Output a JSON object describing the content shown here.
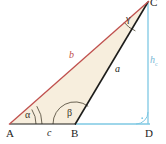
{
  "figure": {
    "kind": "geometry-diagram",
    "background": "#ffffff",
    "fill_color": "#f7eedd",
    "side_b_color": "#c0504d",
    "side_a_color": "#1d1d1b",
    "side_c_color": "#1d1d1b",
    "height_color": "#7ec8e3",
    "arc_color": "#5a5242",
    "label_color": "#1d1d1b"
  },
  "vertices": [
    {
      "name": "A",
      "label": "A",
      "x": 10,
      "y": 124,
      "label_x": 8,
      "label_y": 129
    },
    {
      "name": "B",
      "label": "B",
      "x": 75,
      "y": 124,
      "label_x": 72,
      "label_y": 129
    },
    {
      "name": "C",
      "label": "C",
      "x": 148,
      "y": 2,
      "label_x": 150,
      "label_y": -2
    },
    {
      "name": "D",
      "label": "D",
      "x": 148,
      "y": 124,
      "label_x": 146,
      "label_y": 129
    }
  ],
  "sides": [
    {
      "name": "side-b",
      "label": "b",
      "from": "A",
      "to": "C",
      "color": "#c0504d",
      "label_x": 69,
      "label_y": 51
    },
    {
      "name": "side-a",
      "label": "a",
      "from": "B",
      "to": "C",
      "color": "#1d1d1b",
      "label_x": 115,
      "label_y": 65
    },
    {
      "name": "side-c",
      "label": "c",
      "from": "A",
      "to": "B",
      "color": "#1d1d1b",
      "label_x": 47,
      "label_y": 129
    }
  ],
  "angles": [
    {
      "name": "alpha",
      "label": "α",
      "at": "A",
      "label_x": 25,
      "label_y": 111,
      "marker": "double-arc"
    },
    {
      "name": "beta",
      "label": "β",
      "at": "B",
      "label_x": 68,
      "label_y": 110,
      "marker": "single-arc-obtuse"
    },
    {
      "name": "gamma",
      "label": "γ",
      "at": "C",
      "label_x": 126,
      "label_y": 15,
      "marker": "single-arc"
    },
    {
      "name": "right-angle",
      "label": "",
      "at": "D",
      "label_x": 0,
      "label_y": 0,
      "marker": "right-angle-square"
    }
  ],
  "height": {
    "name": "height-hc",
    "label_main": "h",
    "label_sub": "c",
    "from": "C",
    "to": "D",
    "color": "#7ec8e3",
    "label_x": 150,
    "label_y": 56
  },
  "extension": {
    "name": "base-extension-BD",
    "from": "B",
    "to": "D",
    "color": "#7ec8e3"
  }
}
